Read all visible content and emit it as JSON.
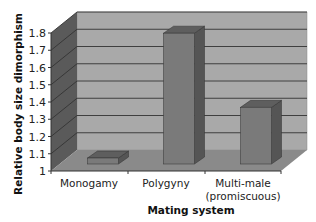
{
  "chart_data": {
    "type": "bar",
    "style": "3d-column",
    "title": "",
    "xlabel": "Mating system",
    "ylabel": "Relative body size dimorphism",
    "categories": [
      "Monogamy",
      "Polygyny",
      "Multi-male (promiscuous)"
    ],
    "category_lines": [
      [
        "Monogamy"
      ],
      [
        "Polygyny"
      ],
      [
        "Multi-male",
        "(promiscuous)"
      ]
    ],
    "values": [
      1.04,
      1.77,
      1.34
    ],
    "ylim": [
      1,
      1.8
    ],
    "yticks": [
      "1",
      "1.1",
      "1.2",
      "1.3",
      "1.4",
      "1.5",
      "1.6",
      "1.7",
      "1.8"
    ],
    "grid": true,
    "legend": null,
    "colors": {
      "bar_front": "#7a7a7a",
      "bar_side": "#555555",
      "bar_top": "#5e5e5e",
      "back_wall": "#a9a9a9",
      "side_wall": "#5a5a5a",
      "floor": "#8a8a8a",
      "gridline": "#333333"
    }
  }
}
